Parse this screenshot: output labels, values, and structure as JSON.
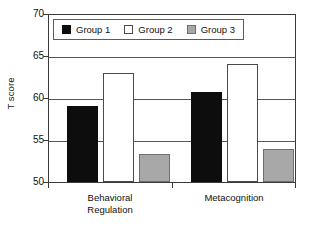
{
  "chart_data": {
    "type": "bar",
    "title": "",
    "xlabel": "",
    "ylabel": "T score",
    "ylim": [
      50,
      70
    ],
    "yticks": [
      50,
      55,
      60,
      65,
      70
    ],
    "ytick_labels": [
      "50",
      "55",
      "60",
      "65",
      "70"
    ],
    "grid": true,
    "grid_axis": "y",
    "legend_position": "upper-left-inside",
    "categories": [
      "Behavioral Regulation",
      "Metacognition"
    ],
    "category_lines": [
      [
        "Behavioral",
        "Regulation"
      ],
      [
        "Metacognition"
      ]
    ],
    "series": [
      {
        "name": "Group 1",
        "color": "#0d0d0d",
        "values": [
          59.0,
          60.6
        ]
      },
      {
        "name": "Group 2",
        "color": "#ffffff",
        "values": [
          62.9,
          64.0
        ]
      },
      {
        "name": "Group 3",
        "color": "#a8a8a8",
        "values": [
          53.3,
          53.9
        ]
      }
    ]
  },
  "legend": {
    "entries": [
      {
        "label": "Group 1"
      },
      {
        "label": "Group 2"
      },
      {
        "label": "Group 3"
      }
    ]
  },
  "axis": {
    "y_title": "T score",
    "y_tick_labels": [
      "70",
      "65",
      "60",
      "55",
      "50"
    ],
    "x_categories": [
      {
        "line1": "Behavioral",
        "line2": "Regulation"
      },
      {
        "line1": "Metacognition",
        "line2": ""
      }
    ]
  }
}
